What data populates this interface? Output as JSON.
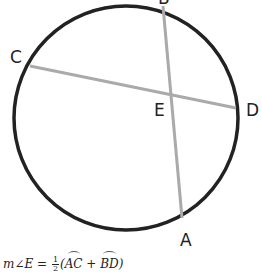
{
  "diagram": {
    "type": "circle-with-intersecting-chords",
    "circle": {
      "cx": 126,
      "cy": 118,
      "r": 112,
      "stroke": "#222222"
    },
    "chords": [
      {
        "name": "CD",
        "from": [
          30,
          66
        ],
        "to": [
          236,
          108
        ],
        "stroke": "#aaaaaa"
      },
      {
        "name": "BA",
        "from": [
          163,
          6
        ],
        "to": [
          182,
          218
        ],
        "stroke": "#aaaaaa"
      }
    ],
    "points": {
      "B": {
        "label": "B",
        "x": 158,
        "y": 4
      },
      "C": {
        "label": "C",
        "x": 10,
        "y": 63
      },
      "E": {
        "label": "E",
        "x": 154,
        "y": 116
      },
      "D": {
        "label": "D",
        "x": 246,
        "y": 116
      },
      "A": {
        "label": "A",
        "x": 180,
        "y": 246
      }
    }
  },
  "formula": {
    "lhs": "m∠E = ",
    "frac_num": "1",
    "frac_den": "2",
    "open": "(",
    "arc1": "AC",
    "plus": " + ",
    "arc2": "BD",
    "close": ")"
  }
}
